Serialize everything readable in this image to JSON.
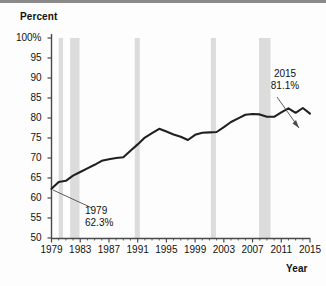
{
  "figure": {
    "background_color": "#fdfdfd",
    "rule_color": "#8a8a8a",
    "line_color": "#231f20",
    "band_color": "#dcdcdc",
    "axis_color": "#4a4a4a"
  },
  "axes": {
    "ylabel": "Percent",
    "xlabel": "Year",
    "yticks": [
      "100%",
      "95",
      "90",
      "85",
      "80",
      "75",
      "70",
      "65",
      "60",
      "55",
      "50"
    ],
    "xticks": [
      "1979",
      "1983",
      "1987",
      "1991",
      "1995",
      "1999",
      "2003",
      "2007",
      "2011",
      "2015"
    ]
  },
  "annotations": {
    "start": {
      "year": "1979",
      "value": "62.3%"
    },
    "end": {
      "year": "2015",
      "value": "81.1%"
    }
  },
  "chart_data": {
    "type": "line",
    "title": "",
    "xlabel": "Year",
    "ylabel": "Percent",
    "xlim": [
      1979,
      2015
    ],
    "ylim": [
      50,
      100
    ],
    "grid": false,
    "legend": null,
    "x": [
      1979,
      1980,
      1981,
      1982,
      1983,
      1984,
      1985,
      1986,
      1987,
      1988,
      1989,
      1990,
      1991,
      1992,
      1993,
      1994,
      1995,
      1996,
      1997,
      1998,
      1999,
      2000,
      2001,
      2002,
      2003,
      2004,
      2005,
      2006,
      2007,
      2008,
      2009,
      2010,
      2011,
      2012,
      2013,
      2014,
      2015
    ],
    "series": [
      {
        "name": "Percent",
        "values": [
          62.3,
          64.0,
          64.3,
          65.6,
          66.5,
          67.4,
          68.3,
          69.3,
          69.7,
          70.0,
          70.2,
          71.8,
          73.4,
          75.1,
          76.2,
          77.3,
          76.6,
          75.9,
          75.3,
          74.5,
          75.8,
          76.3,
          76.4,
          76.5,
          77.7,
          79.0,
          79.9,
          80.8,
          81.0,
          80.9,
          80.3,
          80.3,
          81.4,
          82.4,
          81.3,
          82.5,
          81.1
        ]
      }
    ],
    "annotated_points": [
      {
        "x": 1979,
        "y": 62.3,
        "label": "1979 62.3%"
      },
      {
        "x": 2015,
        "y": 81.1,
        "label": "2015 81.1%"
      }
    ],
    "shaded_bands": [
      {
        "x0": 1980.0,
        "x1": 1980.6,
        "label": "recession"
      },
      {
        "x0": 1981.6,
        "x1": 1982.9,
        "label": "recession"
      },
      {
        "x0": 1990.6,
        "x1": 1991.3,
        "label": "recession"
      },
      {
        "x0": 2001.2,
        "x1": 2001.9,
        "label": "recession"
      },
      {
        "x0": 2007.9,
        "x1": 2009.5,
        "label": "recession"
      }
    ]
  }
}
